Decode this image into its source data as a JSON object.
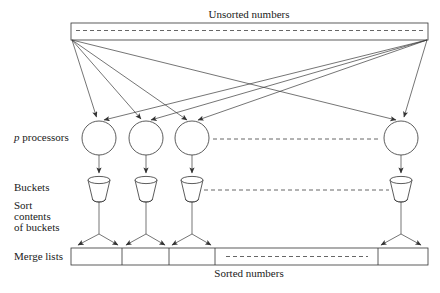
{
  "figure": {
    "title_top": "Unsorted numbers",
    "title_bottom": "Sorted numbers",
    "labels": {
      "processors_italic": "p",
      "processors_rest": " processors",
      "buckets": "Buckets",
      "sort_line1": "Sort",
      "sort_line2": "contents",
      "sort_line3": "of buckets",
      "merge": "Merge lists"
    },
    "colors": {
      "stroke": "#333333",
      "text": "#1a1a1a",
      "dashed": "#555555",
      "background": "#ffffff"
    },
    "stage_names": [
      "unsorted-numbers-array",
      "processors-row",
      "buckets-row",
      "sort-buckets-stage",
      "merge-lists-array"
    ],
    "processor_count_visible": 4,
    "bucket_count_visible": 4,
    "merge_segment_count_visible": 5
  }
}
